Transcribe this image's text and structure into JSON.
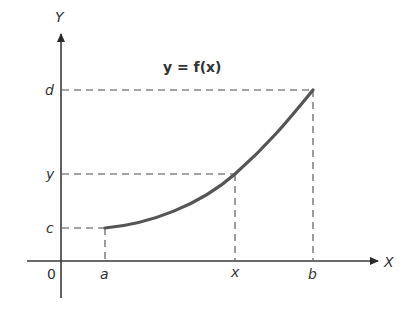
{
  "diagram": {
    "title": "y = f(x)",
    "axes": {
      "x_label": "X",
      "y_label": "Y",
      "origin_label": "0"
    },
    "x_ticks": [
      {
        "label": "a",
        "px": 105
      },
      {
        "label": "x",
        "px": 235
      },
      {
        "label": "b",
        "px": 313
      }
    ],
    "y_ticks": [
      {
        "label": "d",
        "py": 90
      },
      {
        "label": "y",
        "py": 174
      },
      {
        "label": "c",
        "py": 228
      }
    ],
    "curve": {
      "description": "Increasing convex curve from (a, c) through (x, y) to (b, d)",
      "start": [
        "a",
        "c"
      ],
      "mid": [
        "x",
        "y"
      ],
      "end": [
        "b",
        "d"
      ]
    },
    "colors": {
      "axis": "#3a3a3a",
      "curve": "#555555",
      "text": "#333333",
      "background": "#ffffff"
    }
  }
}
